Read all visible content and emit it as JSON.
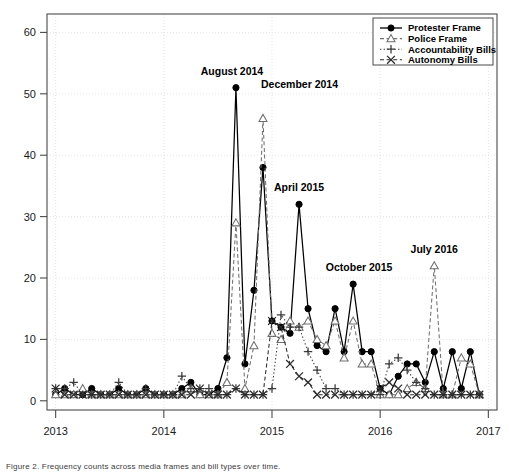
{
  "figure": {
    "caption": "Figure 2. Frequency counts across media frames and bill types over time."
  },
  "chart_data": {
    "type": "line",
    "title": "",
    "xlabel": "",
    "ylabel": "",
    "xlim": [
      2012.92,
      2017.08
    ],
    "ylim": [
      -1.5,
      63
    ],
    "yticks": [
      0,
      10,
      20,
      30,
      40,
      50,
      60
    ],
    "xticks": [
      2013,
      2014,
      2015,
      2016,
      2017
    ],
    "xticklabels": [
      "2013",
      "2014",
      "2015",
      "2016",
      "2017"
    ],
    "grid": "dotted-light",
    "legend_position": "top-right",
    "x_start": "2013-01",
    "x_step_months": 1,
    "x": [
      2013.0,
      2013.0833,
      2013.1667,
      2013.25,
      2013.3333,
      2013.4167,
      2013.5,
      2013.5833,
      2013.6667,
      2013.75,
      2013.8333,
      2013.9167,
      2014.0,
      2014.0833,
      2014.1667,
      2014.25,
      2014.3333,
      2014.4167,
      2014.5,
      2014.5833,
      2014.6667,
      2014.75,
      2014.8333,
      2014.9167,
      2015.0,
      2015.0833,
      2015.1667,
      2015.25,
      2015.3333,
      2015.4167,
      2015.5,
      2015.5833,
      2015.6667,
      2015.75,
      2015.8333,
      2015.9167,
      2016.0,
      2016.0833,
      2016.1667,
      2016.25,
      2016.3333,
      2016.4167,
      2016.5,
      2016.5833,
      2016.6667,
      2016.75,
      2016.8333,
      2016.9167
    ],
    "series": [
      {
        "name": "Protester Frame",
        "marker": "filled-circle",
        "line": "solid",
        "color": "#000000",
        "values": [
          1,
          2,
          1,
          1,
          2,
          1,
          1,
          2,
          1,
          1,
          2,
          1,
          1,
          1,
          2,
          3,
          1,
          1,
          2,
          7,
          51,
          6,
          18,
          38,
          13,
          12,
          11,
          32,
          15,
          9,
          8,
          15,
          8,
          19,
          8,
          8,
          2,
          1,
          4,
          6,
          6,
          3,
          8,
          2,
          8,
          2,
          8,
          1
        ]
      },
      {
        "name": "Police Frame",
        "marker": "open-triangle",
        "line": "dashed",
        "color": "#6f6f6f",
        "values": [
          1,
          1,
          1,
          2,
          1,
          1,
          1,
          1,
          1,
          1,
          1,
          1,
          1,
          1,
          1,
          2,
          1,
          1,
          1,
          3,
          29,
          2,
          9,
          46,
          11,
          10,
          13,
          12,
          13,
          10,
          9,
          13,
          7,
          13,
          6,
          6,
          1,
          1,
          1,
          2,
          3,
          2,
          22,
          1,
          1,
          7,
          6,
          1
        ]
      },
      {
        "name": "Accountability Bills",
        "marker": "plus",
        "line": "dotted",
        "color": "#3a3a3a",
        "values": [
          2,
          2,
          3,
          1,
          1,
          1,
          1,
          3,
          1,
          1,
          2,
          1,
          1,
          1,
          4,
          2,
          2,
          2,
          1,
          1,
          2,
          1,
          1,
          1,
          2,
          14,
          12,
          12,
          8,
          5,
          2,
          2,
          1,
          1,
          1,
          1,
          1,
          6,
          7,
          5,
          3,
          2,
          1,
          1,
          1,
          1,
          1,
          1
        ]
      },
      {
        "name": "Autonomy Bills",
        "marker": "x",
        "line": "dashed",
        "color": "#2a2a2a",
        "values": [
          2,
          1,
          1,
          1,
          1,
          1,
          1,
          1,
          1,
          1,
          1,
          1,
          1,
          1,
          1,
          1,
          2,
          1,
          1,
          1,
          2,
          1,
          1,
          1,
          13,
          12,
          6,
          4,
          3,
          1,
          1,
          1,
          1,
          1,
          1,
          1,
          2,
          3,
          2,
          1,
          1,
          1,
          1,
          1,
          1,
          1,
          1,
          1
        ]
      }
    ],
    "annotations": [
      {
        "label": "August 2014",
        "x": 2014.6667,
        "y": 51,
        "dx": -4,
        "dy": -13,
        "anchor": "middle"
      },
      {
        "label": "December 2014",
        "x": 2014.9167,
        "y": 46,
        "dx": -2,
        "dy": -30,
        "anchor": "start"
      },
      {
        "label": "April 2015",
        "x": 2015.25,
        "y": 32,
        "dx": 0,
        "dy": -13,
        "anchor": "middle"
      },
      {
        "label": "October 2015",
        "x": 2015.75,
        "y": 19,
        "dx": 6,
        "dy": -13,
        "anchor": "middle"
      },
      {
        "label": "July 2016",
        "x": 2016.5,
        "y": 22,
        "dx": 0,
        "dy": -13,
        "anchor": "middle"
      }
    ]
  }
}
